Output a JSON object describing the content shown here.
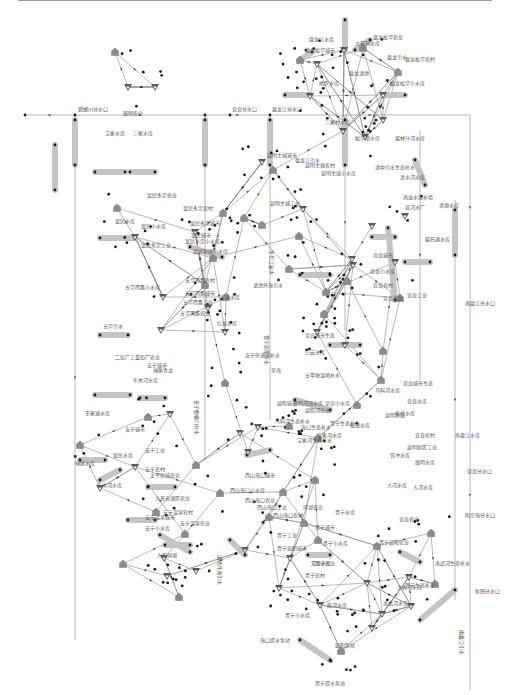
{
  "diagram": {
    "type": "water-resources-network",
    "legend_node_types": [
      "reservoir",
      "demand",
      "junction",
      "river-reach"
    ],
    "colors": {
      "edge": "#8a8a8a",
      "junction": "#1a1a1a",
      "reservoir": "#5a5a5a",
      "demand": "#8c8c8c",
      "reach": "#c4c4c4"
    },
    "labels": {
      "top_cluster": [
        "盘龙江水库",
        "大石洞水库",
        "盘龙松华农业",
        "盘龙松华城市",
        "盘龙引水",
        "盘龙松华农村",
        "盘龙滇池",
        "地区水库",
        "盘龙松华小水库"
      ],
      "main_channel": [
        "螳螂川分水口",
        "宜良分水口",
        "盘龙江分水口"
      ],
      "north_west": [
        "嵩明农业",
        "宝象水库",
        "三家水库"
      ],
      "north_center": [
        "三家村水库",
        "松华坝水库",
        "果林汁河水库",
        "昆明主城城市",
        "盘龙江引水",
        "昆明主城农村",
        "昆明主城小水库",
        "滇中引水生态补水",
        "清水河水库",
        "昆明主城工业"
      ],
      "east_upper": [
        "昌益水源补给",
        "清源水库",
        "显河水厂",
        "柴石滩水库",
        "宜良城市",
        "宜良小水库",
        "宜良农村",
        "宜良农业",
        "宜良工业",
        "南盘江分水口"
      ],
      "west_upper": [
        "富民永定农业",
        "富民永定农村",
        "富民永定城市",
        "富民小水库",
        "富民水定小水库",
        "富民新建小水库",
        "富民永定工业",
        "富民水库",
        "富民城市"
      ],
      "west_middle": [
        "五华西翥农村",
        "五华西翥小水库",
        "五华西翥城市",
        "三多水库",
        "五华西翥工业",
        "五华西翥农业",
        "红坡水库",
        "五华引水",
        "二街厂农业",
        "二街厂工业",
        "安宁城市",
        "禄脿青龙",
        "车木河水库",
        "草海",
        "安宁外流域补水",
        "滇池外海引水"
      ],
      "center": [
        "呈贡城市生态",
        "白云水库",
        "五甲塘湿地补水",
        "呈贡小水库",
        "昆阳河农业",
        "马料河水库",
        "昆阳城市",
        "昆阳河流水库",
        "晋宁生态补水",
        "松茂水库",
        "昆明新城",
        "宝象河水库",
        "海口生态补水",
        "宝象河生态补水",
        "马料河生态补水",
        "大河水库",
        "嵩明水库"
      ],
      "east_middle": [
        "宜良城市生态",
        "宜良水库",
        "板桥水库",
        "宜良农村",
        "南盘江水库",
        "昆明新区工业",
        "宜良分水口",
        "大河水库",
        "阳宗海分水口",
        "宜良农业",
        "铁冲水库"
      ],
      "west_lower": [
        "王家滩水库",
        "安宁城市",
        "安宁工业",
        "安宁农村",
        "禄脿水库",
        "车木河水库",
        "太平新城农业",
        "大普吉湖区农业",
        "安宁温泉农村",
        "安宁温泉城市",
        "安宁温泉农业",
        "安宁小水库",
        "大阳洞湖",
        "富民水库"
      ],
      "south_center": [
        "西山海口城市",
        "西山海口小水库",
        "西山海口农业",
        "西山海口工业",
        "西山海口农村",
        "环湖农业",
        "晋宁水库",
        "晋宁城市",
        "晋宁小水库",
        "晋宁工业",
        "晋宁农业",
        "晋宁农村"
      ],
      "south": [
        "晋宁昆阳城市",
        "双龙水库",
        "晋宁昆阳农业",
        "大春河水库",
        "洛武河水库",
        "柴河水库",
        "晋宁小水库",
        "洛武河生态补水",
        "晋宁生态补水",
        "海口提水泵站",
        "晋宁提水泵站",
        "新田分水口",
        "昆阳泵站"
      ],
      "vertical": [
        "滇池外海引水",
        "牛栏江补水",
        "晋宁昆阳补水",
        "安宁螳螂川补水",
        "南盘江引水"
      ]
    }
  },
  "nodes": {
    "reservoirs": [
      [
        344,
        50
      ],
      [
        310,
        96
      ],
      [
        383,
        95
      ],
      [
        155,
        87
      ],
      [
        128,
        87
      ],
      [
        317,
        64
      ],
      [
        343,
        131
      ],
      [
        365,
        137
      ],
      [
        262,
        162
      ],
      [
        303,
        209
      ],
      [
        383,
        120
      ],
      [
        135,
        237
      ],
      [
        195,
        232
      ],
      [
        163,
        297
      ],
      [
        208,
        308
      ],
      [
        225,
        332
      ],
      [
        161,
        330
      ],
      [
        372,
        226
      ],
      [
        405,
        216
      ],
      [
        352,
        259
      ],
      [
        317,
        332
      ],
      [
        345,
        345
      ],
      [
        353,
        265
      ],
      [
        395,
        262
      ],
      [
        258,
        427
      ],
      [
        170,
        414
      ],
      [
        135,
        467
      ],
      [
        100,
        488
      ],
      [
        164,
        558
      ],
      [
        167,
        576
      ],
      [
        196,
        571
      ],
      [
        240,
        433
      ],
      [
        248,
        452
      ],
      [
        245,
        550
      ],
      [
        290,
        558
      ],
      [
        367,
        583
      ],
      [
        411,
        606
      ],
      [
        409,
        577
      ],
      [
        320,
        605
      ],
      [
        279,
        588
      ],
      [
        372,
        628
      ],
      [
        382,
        614
      ]
    ],
    "demands": [
      [
        300,
        60
      ],
      [
        363,
        48
      ],
      [
        398,
        72
      ],
      [
        115,
        52
      ],
      [
        223,
        213
      ],
      [
        117,
        208
      ],
      [
        244,
        218
      ],
      [
        262,
        225
      ],
      [
        273,
        170
      ],
      [
        205,
        285
      ],
      [
        289,
        269
      ],
      [
        299,
        236
      ],
      [
        213,
        258
      ],
      [
        226,
        297
      ],
      [
        326,
        292
      ],
      [
        347,
        281
      ],
      [
        324,
        314
      ],
      [
        400,
        298
      ],
      [
        383,
        351
      ],
      [
        357,
        405
      ],
      [
        318,
        438
      ],
      [
        289,
        426
      ],
      [
        283,
        492
      ],
      [
        315,
        480
      ],
      [
        269,
        517
      ],
      [
        220,
        493
      ],
      [
        80,
        445
      ],
      [
        156,
        512
      ],
      [
        185,
        534
      ],
      [
        123,
        564
      ],
      [
        179,
        597
      ],
      [
        304,
        523
      ],
      [
        318,
        540
      ],
      [
        377,
        546
      ],
      [
        431,
        533
      ],
      [
        341,
        651
      ],
      [
        435,
        584
      ],
      [
        381,
        380
      ],
      [
        225,
        383
      ],
      [
        148,
        417
      ],
      [
        196,
        465
      ]
    ],
    "junctions_count": 260
  },
  "chart_data": {
    "type": "network",
    "title": "",
    "node_categories": [
      "水库 (reservoir)",
      "用水户 (demand)",
      "节点 (junction)",
      "河段 (reach)"
    ],
    "approx_counts": {
      "reservoirs": 42,
      "demands": 41,
      "junctions": 260,
      "reaches": 40
    },
    "main_inflow_line_y": 115,
    "bottom_outflow_label": "新田分水口"
  }
}
